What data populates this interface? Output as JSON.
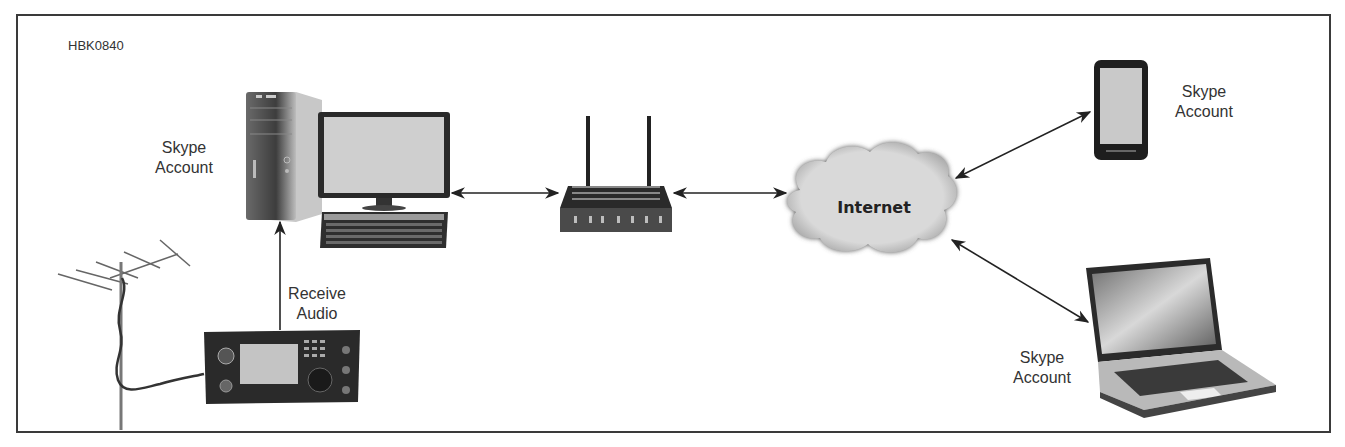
{
  "figure": {
    "id": "HBK0840",
    "nodes": {
      "desktop": {
        "label_line1": "Skype",
        "label_line2": "Account"
      },
      "phone": {
        "label_line1": "Skype",
        "label_line2": "Account"
      },
      "laptop": {
        "label_line1": "Skype",
        "label_line2": "Account"
      },
      "cloud": {
        "label": "Internet"
      },
      "radio_link": {
        "label_line1": "Receive",
        "label_line2": "Audio"
      }
    },
    "edges": [
      {
        "from": "radio",
        "to": "desktop-computer",
        "label": "Receive Audio",
        "direction": "one-way"
      },
      {
        "from": "desktop-computer",
        "to": "router",
        "direction": "two-way"
      },
      {
        "from": "router",
        "to": "internet",
        "direction": "two-way"
      },
      {
        "from": "internet",
        "to": "smartphone",
        "direction": "two-way"
      },
      {
        "from": "internet",
        "to": "laptop",
        "direction": "two-way"
      },
      {
        "from": "antenna",
        "to": "radio",
        "direction": "cable"
      }
    ]
  }
}
